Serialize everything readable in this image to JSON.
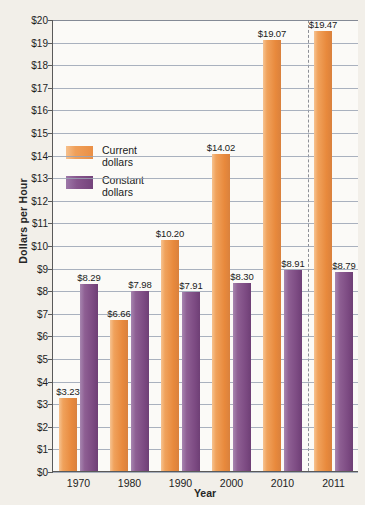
{
  "chart_data": {
    "type": "bar",
    "title": "",
    "xlabel": "Year",
    "ylabel": "Dollars per Hour",
    "categories": [
      "1970",
      "1980",
      "1990",
      "2000",
      "2010",
      "2011"
    ],
    "series": [
      {
        "name": "Current dollars",
        "color": "#ea8f45",
        "values": [
          3.23,
          6.66,
          10.2,
          14.02,
          19.07,
          19.47
        ],
        "labels": [
          "$3.23",
          "$6.66",
          "$10.20",
          "$14.02",
          "$19.07",
          "$19.47"
        ]
      },
      {
        "name": "Constant dollars",
        "color": "#74437b",
        "values": [
          8.29,
          7.98,
          7.91,
          8.3,
          8.91,
          8.79
        ],
        "labels": [
          "$8.29",
          "$7.98",
          "$7.91",
          "$8.30",
          "$8.91",
          "$8.79"
        ]
      }
    ],
    "ylim": [
      0,
      20
    ],
    "ytick_step": 1,
    "yticks": [
      "$0",
      "$1",
      "$2",
      "$3",
      "$4",
      "$5",
      "$6",
      "$7",
      "$8",
      "$9",
      "$10",
      "$11",
      "$12",
      "$13",
      "$14",
      "$15",
      "$16",
      "$17",
      "$18",
      "$19",
      "$20"
    ],
    "grid": true,
    "legend_position": "inside-upper-left",
    "annotations": [
      {
        "type": "vertical-dashed-line",
        "after_category": "2010"
      }
    ]
  },
  "legend": {
    "items": [
      {
        "label_line1": "Current",
        "label_line2": "dollars",
        "swatch": "current"
      },
      {
        "label_line1": "Constant",
        "label_line2": "dollars",
        "swatch": "constant"
      }
    ]
  }
}
